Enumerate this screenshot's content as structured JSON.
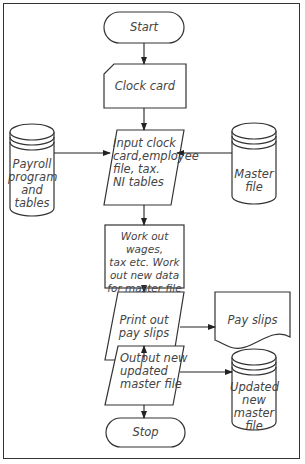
{
  "diagram": {
    "type": "flowchart",
    "nodes": {
      "start": {
        "label": "Start",
        "shape": "terminator"
      },
      "clock_card": {
        "label": "Clock card",
        "shape": "punched-card"
      },
      "input": {
        "label_lines": [
          "Input clock",
          "card,employee",
          "file, tax.",
          "NI tables"
        ],
        "shape": "parallelogram-io"
      },
      "payroll": {
        "label_lines": [
          "Payroll",
          "program",
          "and",
          "tables"
        ],
        "shape": "disk-storage"
      },
      "master": {
        "label_lines": [
          "Master",
          "file"
        ],
        "shape": "disk-storage"
      },
      "process": {
        "label_lines": [
          "Work out wages,",
          "tax etc. Work",
          "out new data",
          "for master file"
        ],
        "shape": "process"
      },
      "print": {
        "label_lines": [
          "Print out",
          "pay slips"
        ],
        "shape": "parallelogram-io"
      },
      "payslips": {
        "label": "Pay slips",
        "shape": "document"
      },
      "output": {
        "label_lines": [
          "Output new",
          "updated",
          "master file"
        ],
        "shape": "parallelogram-io"
      },
      "updated": {
        "label_lines": [
          "Updated",
          "new",
          "master",
          "file"
        ],
        "shape": "disk-storage"
      },
      "stop": {
        "label": "Stop",
        "shape": "terminator"
      }
    },
    "edges": [
      [
        "Start",
        "Clock card"
      ],
      [
        "Clock card",
        "Input clock card,employee file, tax. NI tables"
      ],
      [
        "Payroll program and tables",
        "Input clock card,employee file, tax. NI tables"
      ],
      [
        "Master file",
        "Input clock card,employee file, tax. NI tables"
      ],
      [
        "Input clock card,employee file, tax. NI tables",
        "Work out wages, tax etc. Work out new data for master file"
      ],
      [
        "Work out wages, tax etc. Work out new data for master file",
        "Print out pay slips"
      ],
      [
        "Print out pay slips",
        "Pay slips"
      ],
      [
        "Print out pay slips",
        "Output new updated master file"
      ],
      [
        "Output new updated master file",
        "Updated new master file"
      ],
      [
        "Output new updated master file",
        "Stop"
      ]
    ]
  }
}
